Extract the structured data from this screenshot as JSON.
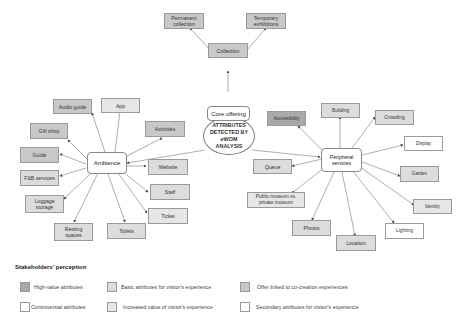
{
  "center": {
    "label": "ATTRIBUTES DETECTED BY eWOM ANALYSIS"
  },
  "hubs": {
    "core": "Core offering",
    "ambience": "Ambience",
    "peripheral": "Peripheral services"
  },
  "core_nodes": {
    "collection": "Collection",
    "permanent": "Permanent collection",
    "temporary": "Temporary exhibitions"
  },
  "ambience_nodes": {
    "audio_guide": "Audio guide",
    "app": "App",
    "activities": "Activities",
    "gift_shop": "Gift shop",
    "guide": "Guide",
    "fb_services": "F&B services",
    "luggage": "Luggage storage",
    "resting": "Resting spaces",
    "toilets": "Toilets",
    "website": "Website",
    "staff": "Staff",
    "ticket": "Ticket"
  },
  "peripheral_nodes": {
    "accessibility": "Accessibility",
    "building": "Building",
    "crowding": "Crowding",
    "display": "Display",
    "garden": "Garden",
    "identity": "Identity",
    "lighting": "Lighting",
    "location": "Location",
    "photos": "Photos",
    "public_private": "Public museum vs. private museum",
    "queue": "Queue"
  },
  "legend": {
    "title": "Stakeholders' perception",
    "items": [
      {
        "label": "High-value attributes",
        "color": "#a9a9a9"
      },
      {
        "label": "Basic attributes for visitor's experience",
        "color": "#dcdcdc"
      },
      {
        "label": "Offer linked to co-creation experiences",
        "color": "#c8c8c8"
      },
      {
        "label": "Controversial attributes",
        "color": "#ffffff"
      },
      {
        "label": "Increased value of visitor's experience",
        "color": "#e6e6e6"
      },
      {
        "label": "Secondary attributes for visitor's experience",
        "color": "#ffffff"
      }
    ]
  }
}
